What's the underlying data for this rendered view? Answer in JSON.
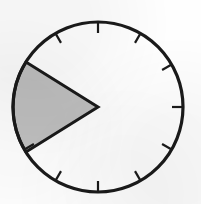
{
  "figure": {
    "kind": "clock-face-sector-diagram",
    "title": "",
    "canvas": {
      "width": 201,
      "height": 204,
      "background": "#fefefe"
    },
    "colors": {
      "outline": "#1a1a1a",
      "sector_fill": "#c0c0c0",
      "sector_outline": "#1a1a1a",
      "tick": "#1a1a1a",
      "dial_face": "#ffffff"
    }
  },
  "clock": {
    "center": {
      "x": 98,
      "y": 107
    },
    "radius": 85,
    "rim_stroke_width": 3.2,
    "tick_count": 12,
    "tick_length": 11,
    "tick_stroke_width": 2.2,
    "tick_angles_deg": [
      0,
      30,
      60,
      90,
      120,
      150,
      180,
      210,
      240,
      270,
      300,
      330
    ],
    "tick_labels": [
      "12",
      "1",
      "2",
      "3",
      "4",
      "5",
      "6",
      "7",
      "8",
      "9",
      "10",
      "11"
    ],
    "hidden_ticks": [
      "9",
      "10"
    ]
  },
  "sector": {
    "label": "shaded sector",
    "fill": "#c0c0c0",
    "stroke": "#1a1a1a",
    "stroke_width": 3.0,
    "apex": {
      "x": 98,
      "y": 107
    },
    "start_point": {
      "x": 26,
      "y": 62
    },
    "end_point": {
      "x": 26,
      "y": 152
    },
    "start_angle_deg": 148,
    "end_angle_deg": 212,
    "sweep_deg": 64,
    "direction": "left",
    "chord_rendered": "arc"
  },
  "annotations": []
}
